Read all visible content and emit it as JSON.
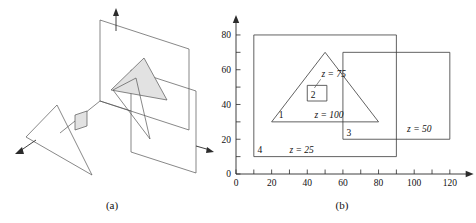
{
  "figure": {
    "caption_a": "(a)",
    "caption_b": "(b)"
  },
  "panel_a": {
    "name": "3d-perspective-view",
    "description": "Isometric view of four polygons at different depths with coordinate axis arrows"
  },
  "chart_data": {
    "type": "diagram",
    "title": "",
    "xlabel": "",
    "ylabel": "",
    "xlim": [
      0,
      130
    ],
    "ylim": [
      0,
      88
    ],
    "grid": false,
    "legend": null,
    "x_ticks": [
      0,
      10,
      20,
      30,
      40,
      50,
      60,
      70,
      80,
      90,
      100,
      110,
      120
    ],
    "x_tick_labels": [
      "0",
      "",
      "20",
      "",
      "40",
      "",
      "60",
      "",
      "80",
      "",
      "100",
      "",
      "120"
    ],
    "y_ticks": [
      0,
      10,
      20,
      30,
      40,
      50,
      60,
      70,
      80
    ],
    "y_tick_labels": [
      "0",
      "",
      "20",
      "",
      "40",
      "",
      "60",
      "",
      "80"
    ],
    "shapes": [
      {
        "id": "4",
        "label": "4",
        "depth_label": "z = 25",
        "kind": "rectangle",
        "points": [
          [
            10,
            10
          ],
          [
            90,
            10
          ],
          [
            90,
            80
          ],
          [
            10,
            80
          ]
        ],
        "label_pos": [
          12,
          12
        ],
        "depth_label_pos": [
          30,
          12
        ]
      },
      {
        "id": "3",
        "label": "3",
        "depth_label": "z = 50",
        "kind": "rectangle",
        "points": [
          [
            60,
            20
          ],
          [
            120,
            20
          ],
          [
            120,
            70
          ],
          [
            60,
            70
          ]
        ],
        "label_pos": [
          62,
          22
        ],
        "depth_label_pos": [
          96,
          24
        ]
      },
      {
        "id": "1",
        "label": "1",
        "depth_label": "z = 100",
        "kind": "triangle",
        "points": [
          [
            20,
            30
          ],
          [
            50,
            70
          ],
          [
            80,
            30
          ]
        ],
        "label_pos": [
          24,
          32
        ],
        "depth_label_pos": [
          44,
          32
        ]
      },
      {
        "id": "2",
        "label": "2",
        "depth_label": "z = 75",
        "kind": "rectangle",
        "points": [
          [
            40,
            42
          ],
          [
            51,
            42
          ],
          [
            51,
            51
          ],
          [
            40,
            51
          ]
        ],
        "label_pos": [
          42,
          44
        ],
        "depth_label_pos": [
          48,
          56
        ]
      }
    ]
  }
}
